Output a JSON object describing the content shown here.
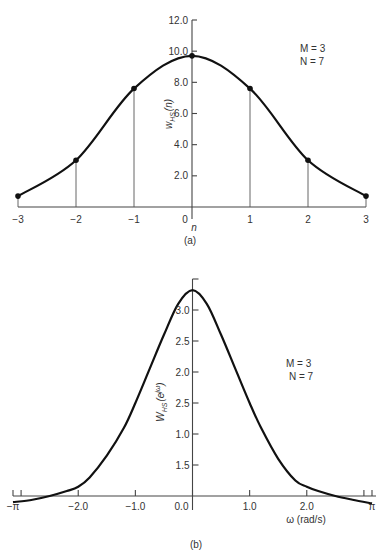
{
  "chart_data": [
    {
      "type": "line",
      "panel_label": "(a)",
      "title": "",
      "xlabel": "n",
      "ylabel": "w_HS(n)",
      "ylabel_main": "w",
      "ylabel_sub": "HS",
      "ylabel_arg": "(n)",
      "annotations": [
        "M = 3",
        "N = 7"
      ],
      "x": [
        -3,
        -2,
        -1,
        0,
        1,
        2,
        3
      ],
      "y": [
        0.7,
        3.0,
        7.6,
        9.7,
        7.6,
        3.0,
        0.7
      ],
      "xlim": [
        -3,
        3
      ],
      "ylim": [
        0,
        12
      ],
      "x_ticks": [
        -3,
        -2,
        -1,
        0,
        1,
        2,
        3
      ],
      "x_tick_labels": [
        "−3",
        "−2",
        "−1",
        "0",
        "1",
        "2",
        "3"
      ],
      "y_ticks": [
        2,
        4,
        6,
        8,
        10,
        12
      ],
      "y_tick_labels": [
        "2.0",
        "4.0",
        "6.0",
        "8.0",
        "10.0",
        "12.0"
      ],
      "markers": "stems with filled dots",
      "grid": false
    },
    {
      "type": "line",
      "panel_label": "(b)",
      "title": "",
      "xlabel": "ω (rad/s)",
      "ylabel": "W_HS(e^jω)",
      "ylabel_main": "W",
      "ylabel_sub": "HS",
      "ylabel_arg": "(e",
      "ylabel_sup": "jω",
      "ylabel_close": ")",
      "annotations": [
        "M = 3",
        "N = 7"
      ],
      "x": [
        -3.1416,
        -2.8,
        -2.5,
        -2.2,
        -2.0,
        -1.8,
        -1.5,
        -1.2,
        -1.0,
        -0.75,
        -0.5,
        -0.25,
        0,
        0.25,
        0.5,
        0.75,
        1.0,
        1.2,
        1.5,
        1.8,
        2.0,
        2.2,
        2.5,
        2.8,
        3.1416
      ],
      "y": [
        -0.1,
        -0.06,
        0.0,
        0.08,
        0.15,
        0.3,
        0.65,
        1.1,
        1.5,
        2.05,
        2.6,
        3.1,
        3.32,
        3.1,
        2.6,
        2.05,
        1.5,
        1.1,
        0.6,
        0.25,
        0.15,
        0.08,
        0.0,
        -0.06,
        -0.12
      ],
      "xlim": [
        -3.1416,
        3.1416
      ],
      "ylim": [
        0,
        3.5
      ],
      "x_ticks": [
        -3.1416,
        -3,
        -2,
        -1,
        0,
        1,
        2,
        3,
        3.1416
      ],
      "x_tick_labels": [
        "−π",
        "",
        "−2.0",
        "−1.0",
        "0.0",
        "1.0",
        "2.0",
        "",
        "π"
      ],
      "y_ticks": [
        0.5,
        1.0,
        1.5,
        2.0,
        2.5,
        3.0,
        3.5
      ],
      "y_tick_labels": [
        "1.5",
        "1.0",
        "2.5",
        "2.0",
        "2.5",
        "3.0",
        ""
      ],
      "grid": false
    }
  ]
}
